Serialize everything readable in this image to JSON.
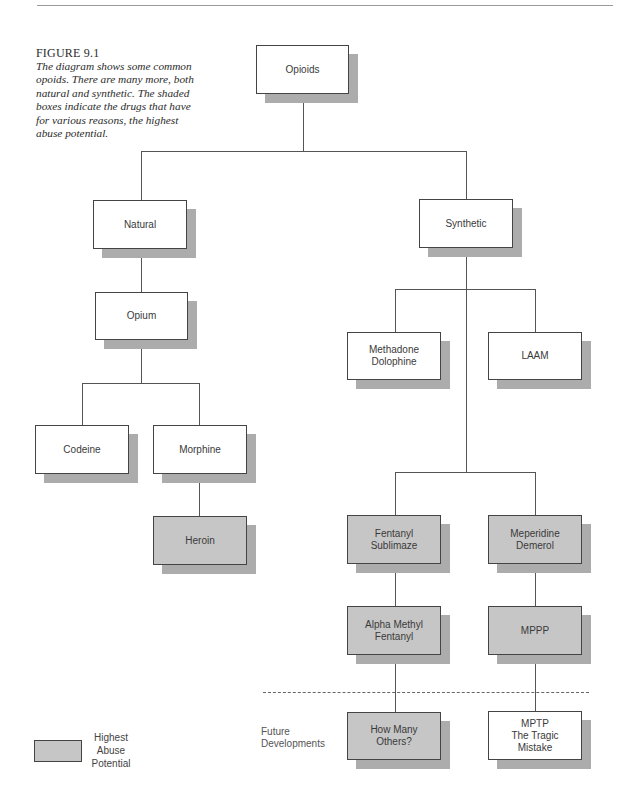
{
  "caption": {
    "figure_label": "FIGURE 9.1",
    "text": "The diagram shows some common opoids. There are many more, both natural and synthetic. The shaded boxes indicate the drugs that have for various reasons, the highest abuse potential."
  },
  "nodes": {
    "opioids": {
      "label": "Opioids",
      "shaded": false
    },
    "natural": {
      "label": "Natural",
      "shaded": false
    },
    "synthetic": {
      "label": "Synthetic",
      "shaded": false
    },
    "opium": {
      "label": "Opium",
      "shaded": false
    },
    "codeine": {
      "label": "Codeine",
      "shaded": false
    },
    "morphine": {
      "label": "Morphine",
      "shaded": false
    },
    "heroin": {
      "label": "Heroin",
      "shaded": true
    },
    "methadone": {
      "label": "Methadone\nDolophine",
      "shaded": false
    },
    "laam": {
      "label": "LAAM",
      "shaded": false
    },
    "fentanyl": {
      "label": "Fentanyl\nSublimaze",
      "shaded": true
    },
    "meperidine": {
      "label": "Meperidine\nDemerol",
      "shaded": true
    },
    "alpha_methyl_fentanyl": {
      "label": "Alpha Methyl\nFentanyl",
      "shaded": true
    },
    "mppp": {
      "label": "MPPP",
      "shaded": true
    },
    "how_many_others": {
      "label": "How Many\nOthers?",
      "shaded": true
    },
    "mptp": {
      "label": "MPTP\nThe Tragic\nMistake",
      "shaded": false
    }
  },
  "edges": [
    [
      "opioids",
      "natural"
    ],
    [
      "opioids",
      "synthetic"
    ],
    [
      "natural",
      "opium"
    ],
    [
      "opium",
      "codeine"
    ],
    [
      "opium",
      "morphine"
    ],
    [
      "morphine",
      "heroin"
    ],
    [
      "synthetic",
      "methadone"
    ],
    [
      "synthetic",
      "laam"
    ],
    [
      "synthetic",
      "fentanyl"
    ],
    [
      "synthetic",
      "meperidine"
    ],
    [
      "fentanyl",
      "alpha_methyl_fentanyl"
    ],
    [
      "meperidine",
      "mppp"
    ],
    [
      "alpha_methyl_fentanyl",
      "how_many_others"
    ],
    [
      "mppp",
      "mptp"
    ]
  ],
  "future_label": "Future\nDevelopments",
  "legend": {
    "label": "Highest\nAbuse\nPotential"
  },
  "colors": {
    "shaded_fill": "#c6c6c6",
    "shadow": "#acacac",
    "border": "#444444",
    "white_fill": "#ffffff"
  }
}
